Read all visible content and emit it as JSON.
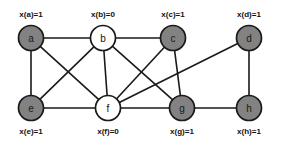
{
  "diagram": {
    "type": "undirected-graph",
    "width": 281,
    "height": 146,
    "background_color": "#ffffff",
    "edge_color": "#1a1a1a",
    "node_fill_selected": "#828282",
    "node_fill_unselected": "#ffffff",
    "node_stroke": "#1a1a1a",
    "node_radius": 12.5,
    "nodes": [
      {
        "id": "a",
        "letter": "a",
        "value_label": "x(a)=1",
        "value": 1,
        "selected": true,
        "cx": 31,
        "cy": 38,
        "label_x": 31,
        "label_y": 17
      },
      {
        "id": "b",
        "letter": "b",
        "value_label": "x(b)=0",
        "value": 0,
        "selected": false,
        "cx": 103,
        "cy": 38,
        "label_x": 103,
        "label_y": 17
      },
      {
        "id": "c",
        "letter": "c",
        "value_label": "x(c)=1",
        "value": 1,
        "selected": true,
        "cx": 173,
        "cy": 38,
        "label_x": 173,
        "label_y": 17
      },
      {
        "id": "d",
        "letter": "d",
        "value_label": "x(d)=1",
        "value": 1,
        "selected": true,
        "cx": 249,
        "cy": 38,
        "label_x": 249,
        "label_y": 17
      },
      {
        "id": "e",
        "letter": "e",
        "value_label": "x(e)=1",
        "value": 1,
        "selected": true,
        "cx": 31,
        "cy": 108,
        "label_x": 31,
        "label_y": 134
      },
      {
        "id": "f",
        "letter": "f",
        "value_label": "x(f)=0",
        "value": 0,
        "selected": false,
        "cx": 108,
        "cy": 108,
        "label_x": 108,
        "label_y": 134
      },
      {
        "id": "g",
        "letter": "g",
        "value_label": "x(g)=1",
        "value": 1,
        "selected": true,
        "cx": 182,
        "cy": 108,
        "label_x": 182,
        "label_y": 134
      },
      {
        "id": "h",
        "letter": "h",
        "value_label": "x(h)=1",
        "value": 1,
        "selected": true,
        "cx": 249,
        "cy": 108,
        "label_x": 249,
        "label_y": 134
      }
    ],
    "edges": [
      {
        "from": "a",
        "to": "b"
      },
      {
        "from": "a",
        "to": "e"
      },
      {
        "from": "a",
        "to": "f"
      },
      {
        "from": "b",
        "to": "c"
      },
      {
        "from": "b",
        "to": "e"
      },
      {
        "from": "b",
        "to": "f"
      },
      {
        "from": "b",
        "to": "g"
      },
      {
        "from": "c",
        "to": "f"
      },
      {
        "from": "c",
        "to": "g"
      },
      {
        "from": "d",
        "to": "f"
      },
      {
        "from": "d",
        "to": "h"
      },
      {
        "from": "e",
        "to": "f"
      },
      {
        "from": "f",
        "to": "g"
      },
      {
        "from": "g",
        "to": "h"
      }
    ]
  }
}
